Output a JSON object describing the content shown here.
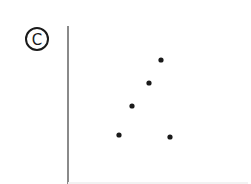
{
  "panel": {
    "label": "C",
    "label_symbol": "©"
  },
  "chart_data": {
    "type": "scatter",
    "title": "",
    "xlabel": "",
    "ylabel": "",
    "grid": false,
    "axes": {
      "y_axis_visible": true,
      "x_axis_visible": false,
      "ticks": false
    },
    "points": [
      {
        "x": 119,
        "y": 135
      },
      {
        "x": 132,
        "y": 106
      },
      {
        "x": 149,
        "y": 83
      },
      {
        "x": 161,
        "y": 60
      },
      {
        "x": 170,
        "y": 137
      }
    ],
    "marker_color": "#1a1a1a",
    "axis_color": "#8a8a8a"
  }
}
